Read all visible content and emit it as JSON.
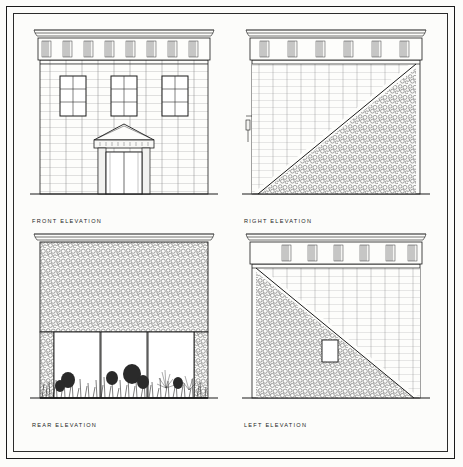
{
  "sheet": {
    "background_color": "#fcfcfa",
    "ink_color": "#1a1a1a",
    "border_color": "#1a1a1a",
    "drawing_type": "architectural elevation drawing set",
    "layout": "2x2 grid of elevations"
  },
  "elevations": [
    {
      "id": "front",
      "caption": "FRONT  ELEVATION",
      "wall_material": "coursed ashlar stone",
      "frieze": {
        "type": "triglyph frieze",
        "count": 8
      },
      "cornice": "molded projecting cornice",
      "windows": {
        "count": 3,
        "type": "6-over-6 double hung",
        "level": "upper storey"
      },
      "entrance": {
        "type": "pedimented doorway",
        "features": [
          "triangular pediment",
          "entablature",
          "flanking pilasters",
          "double door"
        ]
      },
      "ground_line": true
    },
    {
      "id": "right",
      "caption": "RIGHT  ELEVATION",
      "wall_material": "coursed ashlar upper, rubble fieldstone lower",
      "frieze": {
        "type": "triglyph frieze",
        "count": 6
      },
      "cornice": "molded projecting cornice",
      "diagonal": {
        "present": true,
        "direction": "upper-left ashlar to lower-right rubble"
      },
      "windows": {
        "count": 0,
        "type": "none",
        "level": "none"
      },
      "ground_line": true
    },
    {
      "id": "rear",
      "caption": "REAR  ELEVATION",
      "wall_material": "rubble fieldstone",
      "frieze": {
        "type": "plain band",
        "count": 0
      },
      "cornice": "molded projecting cornice",
      "glazing": {
        "bays": 3,
        "type": "large glazed bays",
        "level": "lower storey"
      },
      "landscape": {
        "vegetation": true,
        "description": "shrubs and grasses at base"
      },
      "ground_line": true
    },
    {
      "id": "left",
      "caption": "LEFT  ELEVATION",
      "wall_material": "coursed ashlar upper-right, rubble fieldstone lower-left",
      "frieze": {
        "type": "triglyph frieze",
        "count": 6
      },
      "cornice": "molded projecting cornice",
      "diagonal": {
        "present": true,
        "direction": "upper-right ashlar to lower-left rubble"
      },
      "opening": {
        "count": 1,
        "type": "small rectangular window",
        "level": "lower"
      },
      "ground_line": true
    }
  ]
}
